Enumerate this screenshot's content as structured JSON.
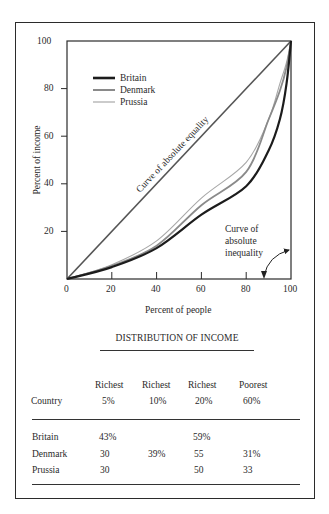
{
  "chart_data": {
    "type": "line",
    "title": "",
    "xlabel": "Percent of people",
    "ylabel": "Percent of income",
    "xlim": [
      0,
      100
    ],
    "ylim": [
      0,
      100
    ],
    "x_ticks": [
      0,
      20,
      40,
      60,
      80,
      100
    ],
    "y_ticks": [
      20,
      40,
      60,
      80,
      100
    ],
    "grid": false,
    "legend_position": "upper left",
    "x": [
      0,
      20,
      40,
      60,
      80,
      90,
      95,
      98,
      100
    ],
    "series": [
      {
        "name": "Curve of absolute equality",
        "values": [
          0,
          20,
          40,
          60,
          80,
          90,
          95,
          98,
          100
        ]
      },
      {
        "name": "Britain",
        "values": [
          0,
          5,
          13,
          27,
          39,
          54,
          67,
          82,
          100
        ]
      },
      {
        "name": "Denmark",
        "values": [
          0,
          5.5,
          14,
          31,
          45,
          67,
          79,
          89,
          100
        ]
      },
      {
        "name": "Prussia",
        "values": [
          0,
          6,
          16,
          34,
          49,
          67,
          82,
          91,
          100
        ]
      }
    ],
    "annotations": [
      {
        "text": "Curve of absolute equality",
        "position": "along diagonal"
      },
      {
        "text": "Curve of absolute inequality",
        "position": "lower right, arrow pointing to bottom and right edges"
      }
    ]
  },
  "chart": {
    "y_tick_labels": [
      "100",
      "80",
      "60",
      "40",
      "20"
    ],
    "x_tick_labels": [
      "0",
      "20",
      "40",
      "60",
      "80",
      "100"
    ],
    "xlabel": "Percent of people",
    "ylabel": "Percent of income",
    "legend": [
      "Britain",
      "Denmark",
      "Prussia"
    ],
    "equality_label": "Curve of absolute equality",
    "inequality_label": [
      "Curve of",
      "absolute",
      "inequality"
    ],
    "colors": {
      "britain": "#1c1c1c",
      "denmark": "#8a8a8a",
      "prussia": "#a8a8a8",
      "axis": "#2b2b2b"
    }
  },
  "table": {
    "title": "DISTRIBUTION OF INCOME",
    "headers_top": [
      "",
      "Richest",
      "Richest",
      "Richest",
      "Poorest"
    ],
    "headers_bottom": [
      "Country",
      "5%",
      "10%",
      "20%",
      "60%"
    ],
    "rows": [
      [
        "Britain",
        "43%",
        "",
        "59%",
        ""
      ],
      [
        "Denmark",
        "30",
        "39%",
        "55",
        "31%"
      ],
      [
        "Prussia",
        "30",
        "",
        "50",
        "33"
      ]
    ]
  }
}
